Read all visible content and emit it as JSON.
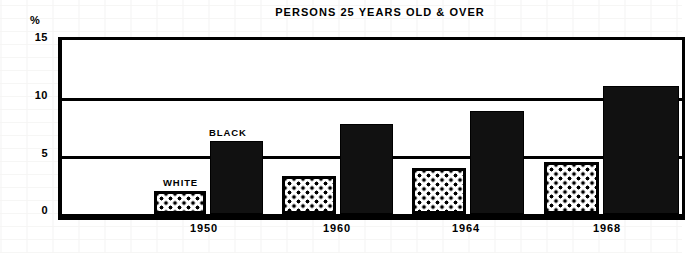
{
  "chart_data": {
    "type": "bar",
    "title": "PERSONS 25 YEARS OLD & OVER",
    "xlabel": "",
    "ylabel": "%",
    "ylim": [
      0,
      15
    ],
    "yticks": [
      "15",
      "10",
      "5",
      "0"
    ],
    "ytick_values": [
      15,
      10,
      5,
      0
    ],
    "grid": true,
    "legend_position": "inline-annotation",
    "categories": [
      "1950",
      "1960",
      "1964",
      "1968"
    ],
    "series": [
      {
        "name": "WHITE",
        "fill": "dotted-stipple",
        "color": "#ffffff",
        "values": [
          2.0,
          3.3,
          4.0,
          4.5
        ]
      },
      {
        "name": "BLACK",
        "fill": "solid",
        "color": "#111111",
        "values": [
          6.3,
          7.8,
          8.9,
          11.0
        ]
      }
    ],
    "annotations": [
      {
        "text": "WHITE",
        "refers_to": "white-bar-1950"
      },
      {
        "text": "BLACK",
        "refers_to": "black-bar-1950"
      }
    ]
  },
  "axis": {
    "unit_symbol": "%",
    "tick_15": "15",
    "tick_10": "10",
    "tick_5": "5",
    "tick_0": "0"
  },
  "xlabels": {
    "c0": "1950",
    "c1": "1960",
    "c2": "1964",
    "c3": "1968"
  },
  "annotations": {
    "white": "WHITE",
    "black": "BLACK"
  },
  "colors": {
    "ink": "#000000",
    "bar_black": "#111111",
    "bar_white": "#ffffff",
    "paper": "#ffffff"
  }
}
